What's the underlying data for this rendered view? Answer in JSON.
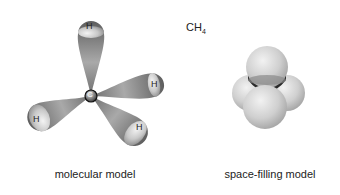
{
  "formula": {
    "base": "CH",
    "subscript": "4"
  },
  "molecular_model": {
    "center_atom": "C",
    "hydrogen_labels": [
      "H",
      "H",
      "H",
      "H"
    ],
    "caption": "molecular model"
  },
  "space_filling_model": {
    "caption": "space-filling model"
  },
  "colors": {
    "bond_lobe": "#8a8a8a",
    "sphere": "#d0d0d0",
    "background": "#ffffff"
  }
}
